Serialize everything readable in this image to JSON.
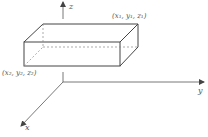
{
  "diagram": {
    "type": "3d-coordinate-box",
    "axes": {
      "z": {
        "label": "z"
      },
      "y": {
        "label": "y"
      },
      "x": {
        "label": "x"
      }
    },
    "points": {
      "corner1": {
        "label": "(x₁, y₁, z₁)"
      },
      "corner2": {
        "label": "(x₂, y₂, z₂)"
      }
    },
    "colors": {
      "line": "#444444",
      "hidden": "#888888",
      "text": "#555555"
    }
  }
}
